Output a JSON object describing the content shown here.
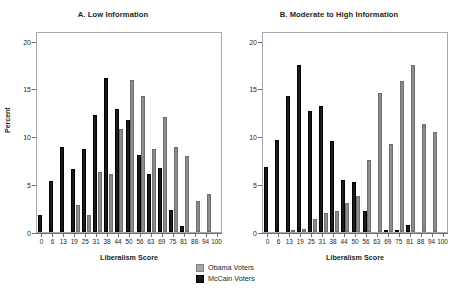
{
  "figure": {
    "ylabel": "Percent",
    "xlabel": "Liberalism Score"
  },
  "legend": {
    "items": [
      {
        "label": "Obama Voters",
        "color": "#a6a8ab",
        "key": "obama"
      },
      {
        "label": "McCain Voters",
        "color": "#1a1a1a",
        "key": "mccain"
      }
    ]
  },
  "chart_data": [
    {
      "type": "bar",
      "title": "A. Low Information",
      "xlabel": "Liberalism Score",
      "ylabel": "Percent",
      "ylim": [
        0,
        21
      ],
      "yticks": [
        0,
        5,
        10,
        15,
        20
      ],
      "grid": false,
      "legend_position": "bottom-center",
      "categories": [
        "0",
        "6",
        "13",
        "19",
        "25",
        "31",
        "38",
        "44",
        "50",
        "56",
        "63",
        "69",
        "75",
        "81",
        "88",
        "94",
        "100"
      ],
      "series": [
        {
          "name": "McCain Voters",
          "color": "#1a1a1a",
          "values": [
            1.8,
            5.3,
            8.9,
            6.6,
            8.7,
            12.2,
            16.1,
            12.9,
            11.7,
            8.0,
            6.1,
            6.7,
            2.3,
            0.6,
            0.0,
            0.0,
            0.0
          ]
        },
        {
          "name": "Obama Voters",
          "color": "#8c8c8c",
          "values": [
            0.0,
            0.0,
            0.0,
            2.8,
            1.8,
            6.3,
            6.1,
            10.8,
            15.9,
            14.2,
            8.7,
            12.0,
            8.9,
            7.9,
            3.2,
            4.0,
            0.0
          ]
        }
      ]
    },
    {
      "type": "bar",
      "title": "B. Moderate to High Information",
      "xlabel": "Liberalism Score",
      "ylabel": "Percent",
      "ylim": [
        0,
        21
      ],
      "yticks": [
        0,
        5,
        10,
        15,
        20
      ],
      "grid": false,
      "legend_position": "bottom-center",
      "categories": [
        "0",
        "6",
        "13",
        "19",
        "25",
        "31",
        "38",
        "44",
        "50",
        "56",
        "63",
        "69",
        "75",
        "81",
        "88",
        "94",
        "100"
      ],
      "series": [
        {
          "name": "McCain Voters",
          "color": "#1a1a1a",
          "values": [
            6.8,
            9.6,
            14.2,
            17.5,
            12.6,
            13.2,
            9.5,
            5.4,
            5.2,
            2.2,
            0.0,
            0.2,
            0.2,
            0.7,
            0.0,
            0.0,
            0.0
          ]
        },
        {
          "name": "Obama Voters",
          "color": "#8c8c8c",
          "values": [
            0.0,
            0.0,
            0.2,
            0.3,
            1.4,
            2.0,
            2.2,
            3.0,
            3.8,
            7.5,
            14.5,
            9.2,
            15.8,
            17.5,
            11.3,
            10.5,
            0.0
          ]
        }
      ]
    }
  ]
}
